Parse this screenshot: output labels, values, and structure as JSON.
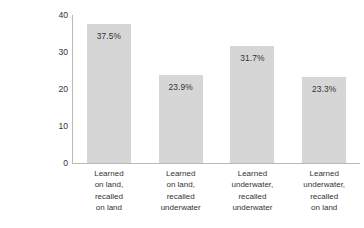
{
  "chart_data": {
    "type": "bar",
    "title": "",
    "subtitle": "",
    "xlabel": "",
    "ylabel": "Percentage of Words Recalled Correctly",
    "ylabel_lines": [
      "Percentage of Words",
      "Recalled Correctly"
    ],
    "ylim": [
      0,
      40
    ],
    "yticks": [
      0,
      10,
      20,
      30,
      40
    ],
    "ytick_labels": [
      "0",
      "10",
      "20",
      "30",
      "40"
    ],
    "grid": false,
    "legend": false,
    "legend_position": "none",
    "bar_color": "#d6d6d6",
    "axis_color": "#b9b9b9",
    "background_color": "#ffffff",
    "categories": [
      "Learned on land, recalled on land",
      "Learned on land, recalled underwater",
      "Learned underwater, recalled underwater",
      "Learned underwater, recalled on land"
    ],
    "category_lines": [
      [
        "Learned",
        "on land,",
        "recalled",
        "on land"
      ],
      [
        "Learned",
        "on land,",
        "recalled",
        "underwater"
      ],
      [
        "Learned",
        "underwater,",
        "recalled",
        "underwater"
      ],
      [
        "Learned",
        "underwater,",
        "recalled",
        "on land"
      ]
    ],
    "values": [
      37.5,
      23.9,
      31.7,
      23.3
    ],
    "value_labels": [
      "37.5%",
      "23.9%",
      "31.7%",
      "23.3%"
    ]
  }
}
